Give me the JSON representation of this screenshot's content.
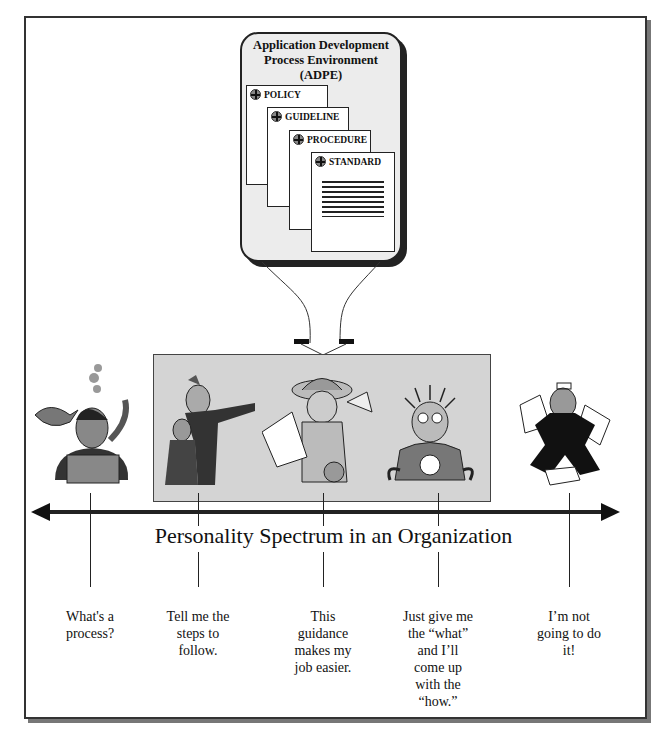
{
  "adpe": {
    "title_line1": "Application Development",
    "title_line2": "Process Environment",
    "title_line3": "(ADPE)",
    "documents": [
      {
        "label": "POLICY"
      },
      {
        "label": "GUIDELINE"
      },
      {
        "label": "PROCEDURE"
      },
      {
        "label": "STANDARD"
      }
    ]
  },
  "spectrum": {
    "title": "Personality Spectrum in an Organization",
    "colors": {
      "line": "#222222",
      "highlight_box": "#d4d4d4",
      "adpe_box": "#ececec"
    },
    "personas": [
      {
        "figure": "diver-person-with-fish",
        "caption": [
          "What's a",
          "process?"
        ]
      },
      {
        "figure": "boss-pointing-with-employee",
        "caption": [
          "Tell me the",
          "steps to",
          "follow."
        ]
      },
      {
        "figure": "explorer-woman-with-papers",
        "caption": [
          "This",
          "guidance",
          "makes my",
          "job easier."
        ]
      },
      {
        "figure": "shocked-electrified-man",
        "caption": [
          "Just give me",
          "the “what”",
          "and I’ll",
          "come up",
          "with the",
          "“how.”"
        ]
      },
      {
        "figure": "angry-man-throwing-papers",
        "caption": [
          "I’m not",
          "going to do",
          "it!"
        ]
      }
    ]
  }
}
